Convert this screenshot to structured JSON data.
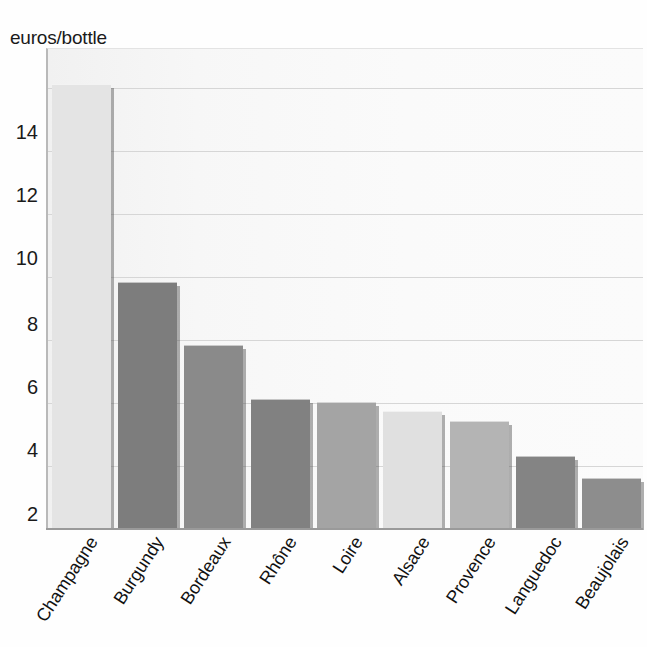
{
  "chart_data": {
    "type": "bar",
    "title": "",
    "subtitle": "",
    "xlabel": "",
    "ylabel": "euros/bottle",
    "ylim": [
      0,
      15
    ],
    "yticks": [
      2,
      4,
      6,
      8,
      10,
      12,
      14
    ],
    "grid": true,
    "legend": "none",
    "orientation": "vertical",
    "categories": [
      "Champagne",
      "Burgundy",
      "Bordeaux",
      "Rhône",
      "Loire",
      "Alsace",
      "Provence",
      "Languedoc",
      "Beaujolais"
    ],
    "values": [
      14.1,
      7.8,
      5.8,
      4.1,
      4.0,
      3.7,
      3.4,
      2.3,
      1.6
    ],
    "bar_colors": [
      "#e4e4e4",
      "#7d7d7d",
      "#8a8a8a",
      "#818181",
      "#a4a4a4",
      "#e0e0e0",
      "#b4b4b4",
      "#848484",
      "#8d8d8d"
    ],
    "plot_background": "#f4f4f4",
    "gridline_color": "#d6d6d6",
    "axis_color": "#9a9a9a",
    "text_color": "#111111"
  }
}
